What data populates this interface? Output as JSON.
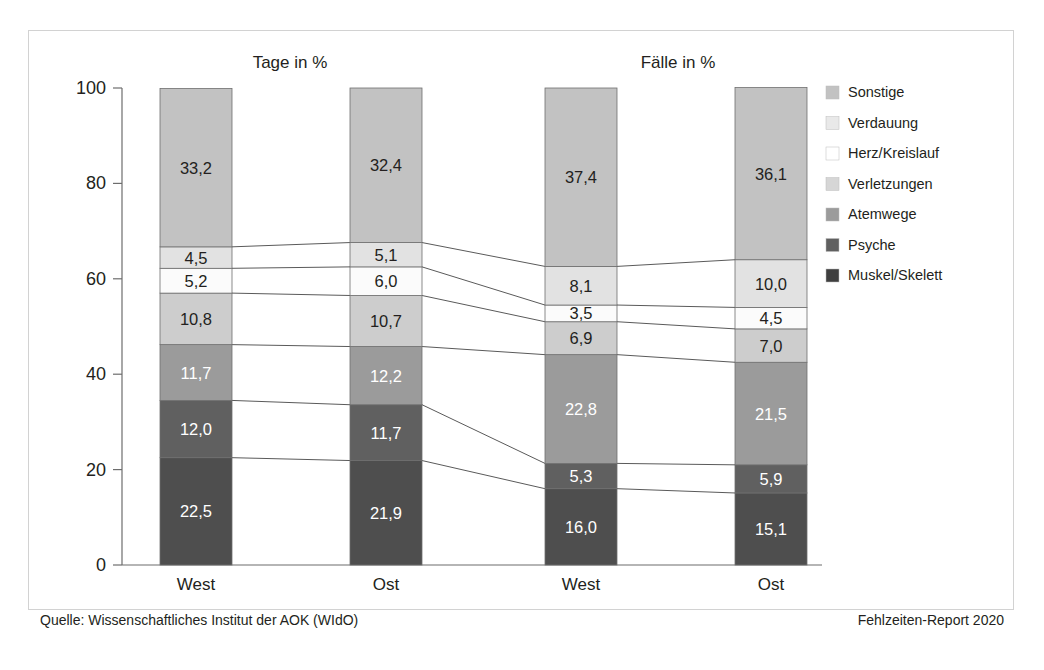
{
  "figure": {
    "footer_left": "Quelle: Wissenschaftliches Institut der AOK (WIdO)",
    "footer_right": "Fehlzeiten-Report 2020"
  },
  "chart_data": {
    "type": "bar",
    "stacked": true,
    "stacked_mode": "percent",
    "title": "",
    "xlabel": "",
    "ylabel": "",
    "ylim": [
      0,
      100
    ],
    "yticks": [
      0,
      20,
      40,
      60,
      80,
      100
    ],
    "ytick_labels": [
      "0",
      "20",
      "40",
      "60",
      "80",
      "100"
    ],
    "grid": false,
    "legend_position": "right",
    "panel_headers": [
      "Tage in %",
      "Fälle in %"
    ],
    "categories": [
      "West",
      "Ost",
      "West",
      "Ost"
    ],
    "category_panels": [
      "Tage in %",
      "Tage in %",
      "Fälle in %",
      "Fälle in %"
    ],
    "series": [
      {
        "name": "Muskel/Skelett",
        "color": "#4e4e4e",
        "label_on_dark": true,
        "values": [
          22.5,
          21.9,
          16.0,
          15.1
        ],
        "value_labels": [
          "22,5",
          "21,9",
          "16,0",
          "15,1"
        ]
      },
      {
        "name": "Psyche",
        "color": "#606060",
        "label_on_dark": true,
        "values": [
          12.0,
          11.7,
          5.3,
          5.9
        ],
        "value_labels": [
          "12,0",
          "11,7",
          "5,3",
          "5,9"
        ]
      },
      {
        "name": "Atemwege",
        "color": "#9b9b9b",
        "label_on_dark": true,
        "values": [
          11.7,
          12.2,
          22.8,
          21.5
        ],
        "value_labels": [
          "11,7",
          "12,2",
          "22,8",
          "21,5"
        ]
      },
      {
        "name": "Verletzungen",
        "color": "#cdcdcd",
        "label_on_dark": false,
        "values": [
          10.8,
          10.7,
          6.9,
          7.0
        ],
        "value_labels": [
          "10,8",
          "10,7",
          "6,9",
          "7,0"
        ]
      },
      {
        "name": "Herz/Kreislauf",
        "color": "#fbfbfb",
        "label_on_dark": false,
        "values": [
          5.2,
          6.0,
          3.5,
          4.5
        ],
        "value_labels": [
          "5,2",
          "6,0",
          "3,5",
          "4,5"
        ]
      },
      {
        "name": "Verdauung",
        "color": "#e2e2e2",
        "label_on_dark": false,
        "values": [
          4.5,
          5.1,
          8.1,
          10.0
        ],
        "value_labels": [
          "4,5",
          "5,1",
          "8,1",
          "10,0"
        ]
      },
      {
        "name": "Sonstige",
        "color": "#c2c2c2",
        "label_on_dark": false,
        "values": [
          33.2,
          32.4,
          37.4,
          36.1
        ],
        "value_labels": [
          "33,2",
          "32,4",
          "37,4",
          "36,1"
        ]
      }
    ],
    "legend_entries": [
      {
        "label": "Sonstige",
        "color": "#c2c2c2"
      },
      {
        "label": "Verdauung",
        "color": "#e9e9e9"
      },
      {
        "label": "Herz/Kreislauf",
        "color": "#ffffff"
      },
      {
        "label": "Verletzungen",
        "color": "#d6d6d6"
      },
      {
        "label": "Atemwege",
        "color": "#9b9b9b"
      },
      {
        "label": "Psyche",
        "color": "#606060"
      },
      {
        "label": "Muskel/Skelett",
        "color": "#3f3f3f"
      }
    ]
  }
}
